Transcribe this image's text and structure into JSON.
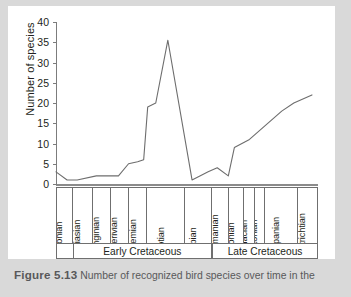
{
  "figure": {
    "caption_label": "Figure 5.13",
    "caption_text": "Number of recognized bird species over time in the"
  },
  "colors": {
    "page_background": "#d9d9d9",
    "panel_background": "#ffffff",
    "line": "#6d6d6d",
    "axis": "#7c7c7c",
    "text": "#231f20",
    "caption_text": "#58585a"
  },
  "chart_data": {
    "type": "line",
    "title": "",
    "xlabel": "",
    "ylabel": "Number of species",
    "ylim": [
      0,
      40
    ],
    "yticks": [
      0,
      5,
      10,
      15,
      20,
      25,
      30,
      35,
      40
    ],
    "grid": false,
    "legend": "none",
    "categories": [
      "Tithonian",
      "Berriasian",
      "Valanginian",
      "Hauterivian",
      "Barremian",
      "Aptian",
      "Albian",
      "Cenomanian",
      "Turonian",
      "Coniacian",
      "Santonian",
      "Campanian",
      "Maastrichtian"
    ],
    "points": [
      {
        "stage": "Tithonian",
        "position": 0.0,
        "value": 3
      },
      {
        "stage": "Tithonian",
        "position": 0.55,
        "value": 1
      },
      {
        "stage": "Berriasian",
        "position": 1.05,
        "value": 1
      },
      {
        "stage": "Valanginian",
        "position": 2.0,
        "value": 2
      },
      {
        "stage": "Hauterivian",
        "position": 3.1,
        "value": 2
      },
      {
        "stage": "Hauterivian",
        "position": 3.6,
        "value": 5
      },
      {
        "stage": "Barremian",
        "position": 4.05,
        "value": 5.5
      },
      {
        "stage": "Barremian",
        "position": 4.35,
        "value": 6
      },
      {
        "stage": "Barremian",
        "position": 4.55,
        "value": 19
      },
      {
        "stage": "Barremian",
        "position": 4.95,
        "value": 20
      },
      {
        "stage": "Aptian",
        "position": 5.55,
        "value": 35.5
      },
      {
        "stage": "Albian",
        "position": 6.75,
        "value": 1
      },
      {
        "stage": "Cenomanian",
        "position": 7.55,
        "value": 3
      },
      {
        "stage": "Cenomanian",
        "position": 8.0,
        "value": 4
      },
      {
        "stage": "Turonian",
        "position": 8.55,
        "value": 2
      },
      {
        "stage": "Coniacian",
        "position": 8.85,
        "value": 9
      },
      {
        "stage": "Santonian",
        "position": 9.6,
        "value": 11
      },
      {
        "stage": "Campanian",
        "position": 11.2,
        "value": 18
      },
      {
        "stage": "Campanian",
        "position": 11.8,
        "value": 20
      },
      {
        "stage": "Maastrichtian",
        "position": 12.7,
        "value": 22
      }
    ],
    "stage_columns": [
      {
        "label": "Tithonian",
        "start": 0,
        "end": 18,
        "period": "none"
      },
      {
        "label": "Berriasian",
        "start": 18,
        "end": 41,
        "period": "Early Cretaceous"
      },
      {
        "label": "Valanginian",
        "start": 41,
        "end": 62,
        "period": "Early Cretaceous"
      },
      {
        "label": "Hauterivian",
        "start": 62,
        "end": 83,
        "period": "Early Cretaceous"
      },
      {
        "label": "Barremian",
        "start": 83,
        "end": 104,
        "period": "Early Cretaceous"
      },
      {
        "label": "Aptian",
        "start": 104,
        "end": 148,
        "period": "Early Cretaceous"
      },
      {
        "label": "Albian",
        "start": 148,
        "end": 179,
        "period": "Early Cretaceous"
      },
      {
        "label": "Cenomanian",
        "start": 179,
        "end": 199,
        "period": "Late Cretaceous"
      },
      {
        "label": "Turonian",
        "start": 199,
        "end": 216,
        "period": "Late Cretaceous"
      },
      {
        "label": "Coniacian",
        "start": 216,
        "end": 228,
        "period": "Late Cretaceous"
      },
      {
        "label": "Santonian",
        "start": 228,
        "end": 240,
        "period": "Late Cretaceous"
      },
      {
        "label": "Campanian",
        "start": 240,
        "end": 278,
        "period": "Late Cretaceous"
      },
      {
        "label": "Maastrichtian",
        "start": 278,
        "end": 300,
        "period": "Late Cretaceous"
      }
    ],
    "period_bands": [
      {
        "label": "",
        "start": 0,
        "end": 18
      },
      {
        "label": "Early Cretaceous",
        "start": 18,
        "end": 179
      },
      {
        "label": "Late Cretaceous",
        "start": 179,
        "end": 300
      }
    ]
  }
}
